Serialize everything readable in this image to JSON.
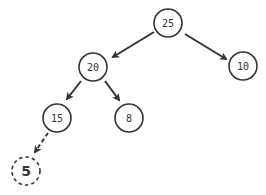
{
  "diagram": {
    "type": "binary-tree (max-heap insertion)",
    "colors": {
      "stroke": "#333333",
      "background": "#ffffff",
      "text": "#333333"
    },
    "nodes": [
      {
        "id": "n25",
        "label": "25",
        "x": 168,
        "y": 23,
        "style": "solid"
      },
      {
        "id": "n20",
        "label": "20",
        "x": 93,
        "y": 67,
        "style": "solid"
      },
      {
        "id": "n10",
        "label": "10",
        "x": 243,
        "y": 66,
        "style": "solid"
      },
      {
        "id": "n15",
        "label": "15",
        "x": 57,
        "y": 118,
        "style": "solid"
      },
      {
        "id": "n8",
        "label": "8",
        "x": 129,
        "y": 118,
        "style": "solid"
      },
      {
        "id": "n5",
        "label": "5",
        "x": 26,
        "y": 171,
        "style": "dashed"
      }
    ],
    "edges": [
      {
        "from": "n25",
        "to": "n20",
        "style": "solid"
      },
      {
        "from": "n25",
        "to": "n10",
        "style": "solid"
      },
      {
        "from": "n20",
        "to": "n15",
        "style": "solid"
      },
      {
        "from": "n20",
        "to": "n8",
        "style": "solid"
      },
      {
        "from": "n15",
        "to": "n5",
        "style": "dashed"
      }
    ]
  }
}
